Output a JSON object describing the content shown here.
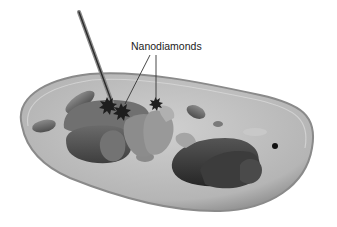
{
  "diagram": {
    "style": "grayscale 3D illustration",
    "labels": [
      {
        "text": "Nanodiamonds",
        "pointers": 2
      }
    ],
    "elements": [
      "cell-membrane",
      "needle-probe",
      "nanodiamond-clusters",
      "nucleus",
      "mitochondria",
      "golgi-apparatus",
      "vesicles"
    ]
  }
}
